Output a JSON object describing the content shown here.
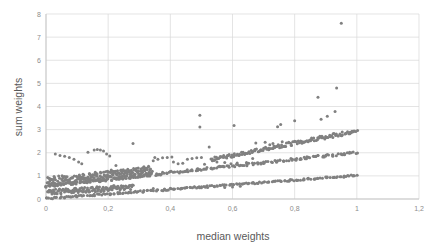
{
  "chart_data": {
    "type": "scatter",
    "title": "",
    "xlabel": "median weights",
    "ylabel": "sum weights",
    "xlim": [
      0,
      1.2
    ],
    "ylim": [
      0,
      8
    ],
    "grid": true,
    "legend": null,
    "marker_color": "#808080",
    "marker_size_px": 3,
    "gridline_color": "#d9d9d9",
    "axis_color": "#bfbfbf",
    "tick_label_color": "#8c8c8c",
    "axis_title_color": "#595959",
    "xticks": [
      0,
      0.2,
      0.4,
      0.6,
      0.8,
      1,
      1.2
    ],
    "xtick_labels": [
      "0",
      "0,2",
      "0,4",
      "0,6",
      "0,8",
      "1",
      "1,2"
    ],
    "yticks": [
      0,
      1,
      2,
      3,
      4,
      5,
      6,
      7,
      8
    ],
    "ytick_labels": [
      "0",
      "1",
      "2",
      "3",
      "4",
      "5",
      "6",
      "7",
      "8"
    ],
    "annotations": [],
    "points": [
      [
        0.95,
        7.6
      ],
      [
        0.935,
        4.8
      ],
      [
        0.875,
        4.4
      ],
      [
        0.93,
        3.78
      ],
      [
        0.905,
        3.58
      ],
      [
        0.885,
        3.45
      ],
      [
        0.8,
        3.38
      ],
      [
        0.755,
        3.22
      ],
      [
        0.745,
        3.12
      ],
      [
        0.605,
        3.18
      ],
      [
        0.495,
        3.62
      ],
      [
        0.495,
        3.11
      ],
      [
        0.525,
        2.25
      ],
      [
        0.705,
        2.45
      ],
      [
        0.675,
        2.42
      ],
      [
        0.73,
        2.4
      ],
      [
        0.76,
        2.48
      ],
      [
        0.72,
        2.35
      ],
      [
        0.28,
        2.4
      ],
      [
        0.135,
        2.02
      ],
      [
        0.155,
        2.12
      ],
      [
        0.165,
        2.14
      ],
      [
        0.175,
        2.12
      ],
      [
        0.185,
        2.08
      ],
      [
        0.195,
        1.95
      ],
      [
        0.205,
        1.86
      ],
      [
        0.03,
        1.95
      ],
      [
        0.045,
        1.88
      ],
      [
        0.06,
        1.85
      ],
      [
        0.075,
        1.8
      ],
      [
        0.09,
        1.72
      ],
      [
        0.105,
        1.6
      ],
      [
        0.115,
        1.52
      ],
      [
        0.35,
        1.8
      ],
      [
        0.36,
        1.72
      ],
      [
        0.375,
        1.78
      ],
      [
        0.39,
        1.8
      ],
      [
        0.405,
        1.82
      ],
      [
        0.345,
        1.65
      ],
      [
        0.41,
        1.6
      ],
      [
        0.425,
        1.52
      ],
      [
        0.44,
        1.55
      ],
      [
        0.455,
        1.72
      ],
      [
        0.47,
        1.75
      ],
      [
        0.485,
        1.78
      ],
      [
        0.5,
        1.8
      ],
      [
        0.315,
        1.4
      ],
      [
        0.33,
        1.42
      ],
      [
        0.305,
        1.3
      ],
      [
        0.29,
        1.22
      ],
      [
        0.275,
        1.18
      ],
      [
        0.51,
        1.5
      ],
      [
        0.55,
        1.6
      ],
      [
        0.575,
        1.58
      ],
      [
        0.595,
        1.52
      ],
      [
        0.615,
        1.56
      ],
      [
        0.645,
        1.58
      ],
      [
        0.665,
        1.75
      ],
      [
        0.225,
        1.45
      ],
      [
        0.245,
        1.2
      ],
      [
        0.255,
        1.15
      ],
      [
        0.21,
        1.25
      ],
      [
        0.235,
        1.12
      ],
      [
        0.575,
        0.5
      ],
      [
        0.6,
        0.52
      ],
      [
        0.625,
        0.55
      ],
      [
        0.445,
        0.48
      ],
      [
        0.465,
        0.5
      ],
      [
        0.4,
        0.47
      ],
      [
        0.345,
        0.45
      ],
      [
        0.5,
        0.49
      ],
      [
        0.52,
        0.5
      ]
    ],
    "bands": [
      {
        "name": "upper-band",
        "x_start": 0.53,
        "x_end": 1.0,
        "y_start": 1.7,
        "y_end": 2.95,
        "thickness": 0.16,
        "density": 150
      },
      {
        "name": "middle-band",
        "x_start": 0.0,
        "x_end": 1.0,
        "y_start": 0.55,
        "y_end": 2.02,
        "thickness": 0.11,
        "density": 210
      },
      {
        "name": "lower-band",
        "x_start": 0.0,
        "x_end": 1.0,
        "y_start": 0.02,
        "y_end": 1.02,
        "thickness": 0.07,
        "density": 200
      },
      {
        "name": "low-cloud",
        "x_start": 0.005,
        "x_end": 0.34,
        "y_start": 0.75,
        "y_end": 1.2,
        "thickness": 0.4,
        "density": 230
      },
      {
        "name": "low-cloud-2",
        "x_start": 0.005,
        "x_end": 0.28,
        "y_start": 0.3,
        "y_end": 0.52,
        "thickness": 0.22,
        "density": 120
      }
    ]
  }
}
